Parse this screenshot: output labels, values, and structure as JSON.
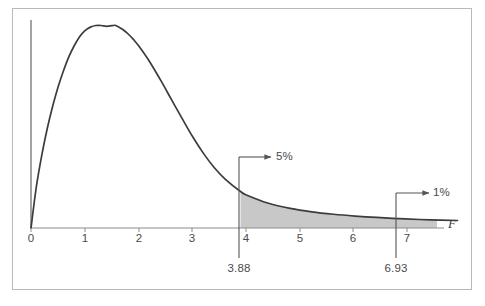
{
  "chart_data": {
    "type": "line",
    "title": "",
    "xlabel": "F",
    "ylabel": "",
    "xlim": [
      0,
      8.25
    ],
    "ylim": [
      0,
      1.08
    ],
    "grid": false,
    "legend": false,
    "curve_description": "F-distribution probability density curve, right-skewed, rising from origin to a peak near F = 1.57 then decaying toward a long right tail",
    "x_ticks": [
      {
        "value": 0,
        "label": "0",
        "px": 31
      },
      {
        "value": 1,
        "label": "1",
        "px": 85
      },
      {
        "value": 2,
        "label": "2",
        "px": 139
      },
      {
        "value": 3,
        "label": "3",
        "px": 192
      },
      {
        "value": 4,
        "label": "4",
        "px": 246
      },
      {
        "value": 5,
        "label": "5",
        "px": 300
      },
      {
        "value": 6,
        "label": "6",
        "px": 353
      },
      {
        "value": 7,
        "label": "7",
        "px": 407
      }
    ],
    "peak": {
      "x": 1.57,
      "y": 1.0
    },
    "series": [
      {
        "name": "F density",
        "x": [
          0.0,
          0.1,
          0.2,
          0.3,
          0.4,
          0.5,
          0.6,
          0.7,
          0.8,
          0.9,
          1.0,
          1.1,
          1.2,
          1.3,
          1.4,
          1.5,
          1.57,
          1.7,
          1.8,
          1.9,
          2.0,
          2.2,
          2.4,
          2.6,
          2.8,
          3.0,
          3.2,
          3.4,
          3.6,
          3.88,
          4.0,
          4.4,
          4.8,
          5.2,
          5.6,
          6.0,
          6.4,
          6.93,
          7.4,
          7.9
        ],
        "y": [
          0.0,
          0.205,
          0.36,
          0.49,
          0.6,
          0.695,
          0.775,
          0.845,
          0.9,
          0.945,
          0.975,
          0.992,
          1.0,
          1.0,
          0.996,
          0.999,
          1.0,
          0.98,
          0.958,
          0.93,
          0.897,
          0.82,
          0.73,
          0.635,
          0.54,
          0.448,
          0.366,
          0.296,
          0.24,
          0.18,
          0.162,
          0.122,
          0.097,
          0.08,
          0.068,
          0.059,
          0.052,
          0.045,
          0.04,
          0.037
        ]
      }
    ],
    "shaded_region": {
      "label": "right tail beyond 3.88",
      "from": 3.88,
      "to": 8.25,
      "color": "#c8c8c8"
    },
    "annotations": [
      {
        "id": "five-percent",
        "text": "5%",
        "critical_value": "3.88",
        "x": 3.88,
        "marker_px": 239,
        "arrow_y_px": 157,
        "arrow_to_px": 272
      },
      {
        "id": "one-percent",
        "text": "1%",
        "critical_value": "6.93",
        "x": 6.93,
        "marker_px": 396,
        "arrow_y_px": 193,
        "arrow_to_px": 430
      }
    ],
    "colors": {
      "curve": "#3c3c3c",
      "axis": "#8c8c8c",
      "shading": "#c8c8c8",
      "annotation": "#555555",
      "text": "#4a4a4a",
      "frame": "#b9b9bd",
      "background": "#ffffff"
    }
  },
  "axis": {
    "x_name": "F",
    "ticks": [
      "0",
      "1",
      "2",
      "3",
      "4",
      "5",
      "6",
      "7"
    ]
  },
  "annotations": {
    "five_percent": {
      "percent_label": "5%",
      "critical_label": "3.88"
    },
    "one_percent": {
      "percent_label": "1%",
      "critical_label": "6.93"
    }
  }
}
